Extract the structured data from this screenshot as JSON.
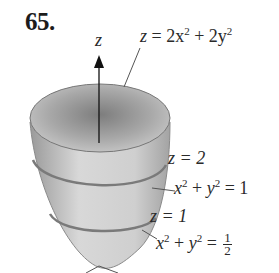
{
  "exercise": {
    "number": "65."
  },
  "figure": {
    "type": "paraboloid",
    "axis_label": "z",
    "labels": {
      "surface_eq": {
        "lhs": "z",
        "rhs_a": "2x",
        "rhs_b": "2y",
        "exp": "2"
      },
      "level_z2": {
        "text": "z = 2"
      },
      "circle_1": {
        "x": "x",
        "y": "y",
        "exp": "2",
        "rhs": "1"
      },
      "level_z1": {
        "text": "z = 1"
      },
      "circle_half": {
        "x": "x",
        "y": "y",
        "exp": "2",
        "num": "1",
        "den": "2"
      }
    },
    "colors": {
      "surface_light": "#d9d9d9",
      "surface_dark": "#8c8c8c",
      "ring": "#7a7a7a",
      "rim": "#6f6f6f",
      "axis": "#111111"
    }
  }
}
